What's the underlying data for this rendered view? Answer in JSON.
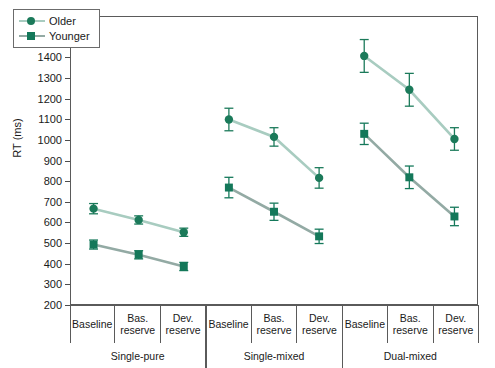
{
  "chart_data": {
    "type": "line",
    "title": "",
    "xlabel": "",
    "ylabel": "RT (ms)",
    "ylim": [
      200,
      1600
    ],
    "ytick_step": 100,
    "yticks": [
      1600,
      1500,
      1400,
      1300,
      1200,
      1100,
      1000,
      900,
      800,
      700,
      600,
      500,
      400,
      300,
      200
    ],
    "grid": false,
    "legend_position": "top-left",
    "x_condition_labels": [
      "Baseline",
      "Bas. reserve",
      "Dev. reserve"
    ],
    "groups": [
      "Single-pure",
      "Single-mixed",
      "Dual-mixed"
    ],
    "categories": [
      "Single-pure / Baseline",
      "Single-pure / Bas. reserve",
      "Single-pure / Dev. reserve",
      "Single-mixed / Baseline",
      "Single-mixed / Bas. reserve",
      "Single-mixed / Dev. reserve",
      "Dual-mixed / Baseline",
      "Dual-mixed / Bas. reserve",
      "Dual-mixed / Dev. reserve"
    ],
    "series": [
      {
        "name": "Older",
        "marker": "circle",
        "color": "#1b7a5a",
        "line_color": "#a8ccc0",
        "values": [
          665,
          610,
          550,
          1100,
          1015,
          815,
          1410,
          1245,
          1005
        ],
        "errors": [
          25,
          20,
          20,
          55,
          45,
          50,
          80,
          80,
          55
        ]
      },
      {
        "name": "Younger",
        "marker": "square",
        "color": "#14785a",
        "line_color": "#93aaa4",
        "values": [
          490,
          440,
          383,
          768,
          650,
          530,
          1030,
          818,
          627
        ],
        "errors": [
          22,
          20,
          20,
          50,
          42,
          35,
          52,
          55,
          45
        ]
      }
    ]
  },
  "axis": {
    "ylabel": "RT (ms)",
    "ytick_labels": [
      "1600",
      "1500",
      "1400",
      "1300",
      "1200",
      "1100",
      "1000",
      "900",
      "800",
      "700",
      "600",
      "500",
      "400",
      "300",
      "200"
    ]
  },
  "legend": {
    "items": [
      {
        "label": "Older",
        "marker": "circle-marker"
      },
      {
        "label": "Younger",
        "marker": "square-marker"
      }
    ]
  },
  "xaxis": {
    "cells": [
      {
        "line1": "Baseline",
        "line2": ""
      },
      {
        "line1": "Bas.",
        "line2": "reserve"
      },
      {
        "line1": "Dev.",
        "line2": "reserve"
      },
      {
        "line1": "Baseline",
        "line2": ""
      },
      {
        "line1": "Bas.",
        "line2": "reserve"
      },
      {
        "line1": "Dev.",
        "line2": "reserve"
      },
      {
        "line1": "Baseline",
        "line2": ""
      },
      {
        "line1": "Bas.",
        "line2": "reserve"
      },
      {
        "line1": "Dev.",
        "line2": "reserve"
      }
    ],
    "groups": [
      "Single-pure",
      "Single-mixed",
      "Dual-mixed"
    ]
  },
  "colors": {
    "older_marker": "#1b7a5a",
    "older_line": "#a8ccc0",
    "younger_marker": "#14785a",
    "younger_line": "#93aaa4",
    "axis": "#5a5a5a",
    "text": "#1a1a1a"
  }
}
